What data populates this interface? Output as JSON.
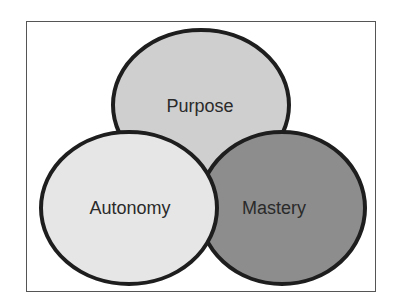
{
  "diagram": {
    "type": "venn",
    "circles": [
      {
        "id": "purpose",
        "label": "Purpose",
        "fill": "#cfcfcf",
        "cx": 201,
        "cy": 105,
        "rx": 88,
        "ry": 75
      },
      {
        "id": "mastery",
        "label": "Mastery",
        "fill": "#8d8d8d",
        "cx": 282,
        "cy": 208,
        "rx": 83,
        "ry": 76
      },
      {
        "id": "autonomy",
        "label": "Autonomy",
        "fill": "#e6e6e6",
        "cx": 129,
        "cy": 208,
        "rx": 88,
        "ry": 76
      }
    ],
    "stroke": "#1e1e1e"
  }
}
